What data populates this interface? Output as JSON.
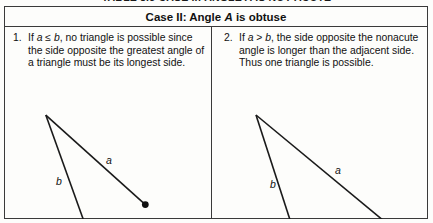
{
  "caption": {
    "text": "TABLE 8.3 CASE II: ANGLE A IS NOT ACUTE"
  },
  "table": {
    "header": {
      "prefix": "Case II: Angle ",
      "variable": "A",
      "suffix": " is obtuse"
    },
    "cells": [
      {
        "number": "1.",
        "text_before": "If ",
        "var_a": "a",
        "relation": " ≤ ",
        "var_b": "b",
        "text_after": ", no triangle is possible since the side opposite the greatest angle of a triangle must be its longest side.",
        "figure": {
          "type": "open-triangle",
          "vertex_labels": [
            "A"
          ],
          "side_labels": [
            "a",
            "b"
          ],
          "has_endpoint_dot": true,
          "description": "Side a swings short of the ray from A; no closure"
        }
      },
      {
        "number": "2.",
        "text_before": "If ",
        "var_a": "a",
        "relation": " > ",
        "var_b": "b",
        "text_after": ", the side opposite the nonacute angle is longer than the adjacent side. Thus one triangle is possible.",
        "figure": {
          "type": "closed-triangle",
          "vertex_labels": [
            "A",
            "B"
          ],
          "side_labels": [
            "a",
            "b"
          ],
          "has_endpoint_dot": true,
          "description": "Triangle closes at B on the ray from A"
        }
      }
    ]
  },
  "figure_left": {
    "apex": {
      "x": 41,
      "y": 88
    },
    "vertex_a": {
      "x": 83,
      "y": 205
    },
    "dot": {
      "x": 141,
      "y": 178
    },
    "ray_end": {
      "x": 197,
      "y": 207
    },
    "label_a": {
      "x": 101,
      "y": 128,
      "text": "a"
    },
    "label_b": {
      "x": 51,
      "y": 149,
      "text": "b"
    },
    "label_A": {
      "x": 74,
      "y": 206,
      "text": "A"
    }
  },
  "figure_right": {
    "apex": {
      "x": 44,
      "y": 88
    },
    "vertex_a": {
      "x": 80,
      "y": 200
    },
    "vertex_b": {
      "x": 178,
      "y": 200
    },
    "label_a": {
      "x": 123,
      "y": 138,
      "text": "a"
    },
    "label_b": {
      "x": 58,
      "y": 152,
      "text": "b"
    },
    "label_A": {
      "x": 72,
      "y": 202,
      "text": "A"
    },
    "label_B": {
      "x": 186,
      "y": 203,
      "text": "B"
    }
  },
  "colors": {
    "stroke": "#1a1a1a",
    "border": "#3a3a3a",
    "background": "#fdfdfb",
    "text": "#111111"
  }
}
